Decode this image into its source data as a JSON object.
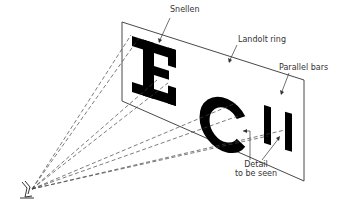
{
  "diagram": {
    "labels": {
      "snellen": "Snellen",
      "landolt": "Landolt ring",
      "parallel": "Parallel bars",
      "detail_line1": "Detail",
      "detail_line2": "to be seen"
    },
    "elements": {
      "chart_panel": "Test chart plane",
      "snellen_letter": "E",
      "landolt_ring": "C",
      "parallel_bars": "II",
      "eye": "eye-icon"
    },
    "colors": {
      "ink": "#000000",
      "line": "#333333",
      "background": "#ffffff"
    }
  }
}
